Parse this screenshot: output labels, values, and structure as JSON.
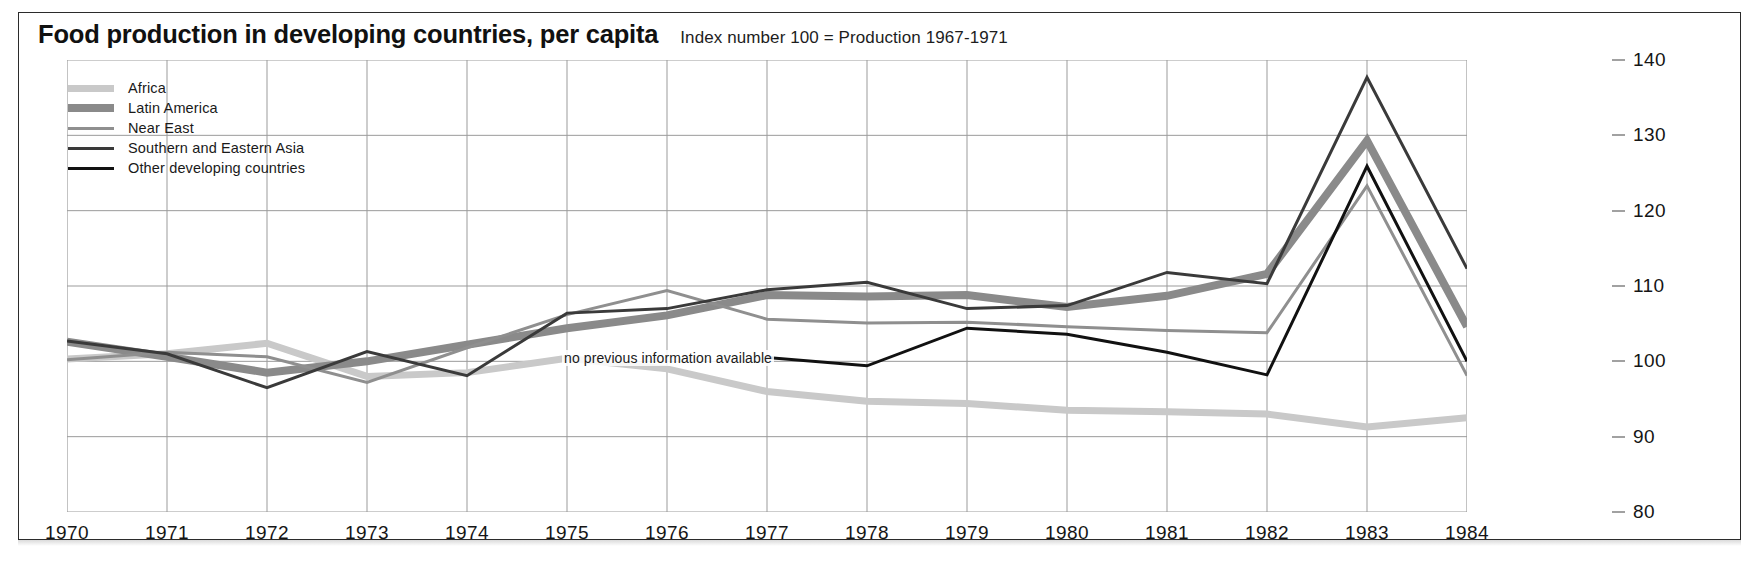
{
  "header": {
    "title": "Food production in developing countries, per capita",
    "subtitle": "Index number 100 = Production 1967-1971"
  },
  "annotation": {
    "text": "no previous information available"
  },
  "legend": {
    "entries": [
      {
        "label": "Africa",
        "color": "#c9c9c9",
        "width": 7
      },
      {
        "label": "Latin America",
        "color": "#8a8a8a",
        "width": 8
      },
      {
        "label": "Near East",
        "color": "#8f8f8f",
        "width": 3
      },
      {
        "label": "Southern and Eastern Asia",
        "color": "#3a3a3a",
        "width": 3
      },
      {
        "label": "Other developing countries",
        "color": "#111111",
        "width": 3
      }
    ]
  },
  "axes": {
    "x_ticks": [
      "1970",
      "1971",
      "1972",
      "1973",
      "1974",
      "1975",
      "1976",
      "1977",
      "1978",
      "1979",
      "1980",
      "1981",
      "1982",
      "1983",
      "1984"
    ],
    "y_ticks": [
      "140",
      "130",
      "120",
      "110",
      "100",
      "90",
      "80"
    ]
  },
  "chart_data": {
    "type": "line",
    "title": "Food production in developing countries, per capita",
    "subtitle": "Index number 100 = Production 1967-1971",
    "xlabel": "",
    "ylabel": "Index number 100 = Production 1967-1971",
    "xlim": [
      1970,
      1984
    ],
    "ylim": [
      80,
      140
    ],
    "grid": true,
    "legend_position": "top-left",
    "annotations": [
      {
        "text": "no previous information available",
        "x": 1977,
        "y": 100.5
      }
    ],
    "x": [
      1970,
      1971,
      1972,
      1973,
      1974,
      1975,
      1976,
      1977,
      1978,
      1979,
      1980,
      1981,
      1982,
      1983,
      1984
    ],
    "series": [
      {
        "name": "Africa",
        "color": "#c9c9c9",
        "linewidth": 7,
        "values": [
          100.3,
          101.0,
          102.4,
          98.0,
          98.5,
          100.4,
          99.0,
          96.0,
          94.7,
          94.4,
          93.5,
          93.3,
          93.0,
          91.3,
          92.5
        ]
      },
      {
        "name": "Latin America",
        "color": "#8a8a8a",
        "linewidth": 8,
        "values": [
          102.6,
          100.6,
          98.5,
          100.0,
          102.2,
          104.4,
          106.1,
          108.8,
          108.6,
          108.8,
          107.2,
          108.7,
          111.6,
          129.3,
          104.6
        ]
      },
      {
        "name": "Near East",
        "color": "#8f8f8f",
        "linewidth": 3,
        "values": [
          100.2,
          101.2,
          100.6,
          97.2,
          101.8,
          106.2,
          109.4,
          105.6,
          105.1,
          105.2,
          104.6,
          104.1,
          103.8,
          123.3,
          98.1
        ]
      },
      {
        "name": "Southern and Eastern Asia",
        "color": "#3a3a3a",
        "linewidth": 3,
        "values": [
          102.7,
          101.0,
          96.5,
          101.3,
          98.1,
          106.4,
          107.0,
          109.5,
          110.5,
          107.0,
          107.4,
          111.8,
          110.3,
          137.7,
          112.3
        ]
      },
      {
        "name": "Other developing countries",
        "color": "#111111",
        "linewidth": 3,
        "note": "no previous information available before 1977",
        "start_year": 1977,
        "values": [
          null,
          null,
          null,
          null,
          null,
          null,
          null,
          100.5,
          99.4,
          104.4,
          103.6,
          101.2,
          98.2,
          125.9,
          100.0
        ]
      }
    ]
  }
}
